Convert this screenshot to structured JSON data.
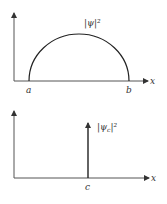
{
  "top_plot": {
    "curve_label": "|ψ|²",
    "x_axis_label": "x",
    "left_marker": "a",
    "right_marker": "b",
    "shape": "semicircle"
  },
  "bottom_plot": {
    "spike_label_base": "|ψ",
    "spike_label_sub": "c",
    "spike_label_tail": "|²",
    "x_axis_label": "x",
    "spike_marker": "c",
    "shape": "delta-spike"
  },
  "colors": {
    "axis": "#555555",
    "curve": "#222222",
    "text": "#333333"
  }
}
